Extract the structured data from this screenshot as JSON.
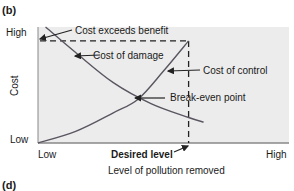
{
  "chart_data": {
    "type": "line",
    "panel_label": "(b)",
    "next_panel_label": "(d)",
    "xlabel": "Level of pollution removed",
    "ylabel": "Cost",
    "x_ticks": [
      "Low",
      "High"
    ],
    "y_ticks": [
      "Low",
      "High"
    ],
    "xlim": [
      0,
      1
    ],
    "ylim": [
      0,
      1
    ],
    "series": [
      {
        "name": "Cost of damage",
        "x": [
          0.03,
          0.15,
          0.3,
          0.45,
          0.6,
          0.66
        ],
        "y": [
          1.0,
          0.78,
          0.52,
          0.34,
          0.22,
          0.18
        ]
      },
      {
        "name": "Cost of control",
        "x": [
          0.0,
          0.15,
          0.3,
          0.4,
          0.5,
          0.6
        ],
        "y": [
          0.0,
          0.1,
          0.26,
          0.38,
          0.62,
          0.88
        ]
      }
    ],
    "annotations": {
      "cost_exceeds_benefit": "Cost exceeds benefit",
      "cost_of_damage": "Cost of damage",
      "cost_of_control": "Cost of control",
      "break_even": "Break-even point",
      "desired_level": "Desired level"
    },
    "desired_level_x": 0.6,
    "desired_level_y": 0.88,
    "break_even": [
      0.36,
      0.38
    ],
    "colors": {
      "curve": "#5a5560",
      "plot_bg": "#ececec",
      "axis": "#777777"
    }
  }
}
